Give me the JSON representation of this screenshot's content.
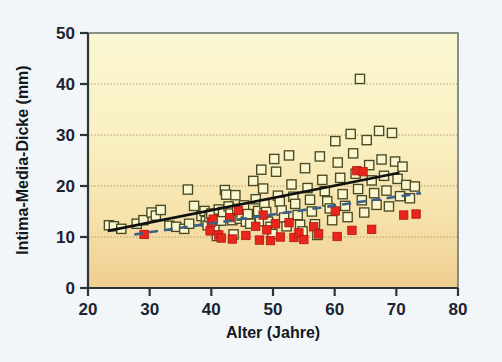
{
  "figure": {
    "background_color": "#f2f6f9",
    "plot_bg_top_color": "#faf6cf",
    "plot_bg_bottom_color": "#f0cf93",
    "plot_border_color": "#4c5a5a"
  },
  "chart_data": {
    "type": "scatter",
    "title": "",
    "xlabel": "Alter (Jahre)",
    "ylabel": "Intima-Media-Dicke (mm)",
    "xlim": [
      20,
      80
    ],
    "ylim": [
      0,
      50
    ],
    "xticks": [
      20,
      30,
      40,
      50,
      60,
      70,
      80
    ],
    "yticks": [
      0,
      10,
      20,
      30,
      40,
      50
    ],
    "grid": "horizontal-dotted",
    "gridlines_y": [
      10,
      20,
      30,
      40
    ],
    "legend": "none",
    "series": [
      {
        "name": "open-square-series",
        "marker": "open-square",
        "marker_color": "#faf6cf",
        "marker_edge_color": "#4a4a22",
        "points": [
          [
            23.4,
            12.3
          ],
          [
            24.2,
            12.1
          ],
          [
            25.4,
            11.6
          ],
          [
            27.9,
            12.6
          ],
          [
            29.0,
            13.3
          ],
          [
            30.3,
            14.8
          ],
          [
            31.0,
            14.2
          ],
          [
            31.8,
            15.3
          ],
          [
            33.2,
            12.2
          ],
          [
            34.3,
            12.0
          ],
          [
            35.6,
            11.6
          ],
          [
            36.2,
            19.3
          ],
          [
            36.4,
            12.6
          ],
          [
            37.2,
            16.1
          ],
          [
            38.4,
            14.1
          ],
          [
            38.9,
            15.1
          ],
          [
            39.1,
            13.1
          ],
          [
            39.4,
            12.3
          ],
          [
            39.7,
            13.9
          ],
          [
            40.0,
            14.6
          ],
          [
            40.2,
            12.7
          ],
          [
            40.5,
            11.8
          ],
          [
            40.9,
            10.2
          ],
          [
            41.2,
            15.4
          ],
          [
            41.6,
            13.2
          ],
          [
            41.9,
            14.9
          ],
          [
            42.2,
            19.2
          ],
          [
            42.4,
            18.3
          ],
          [
            42.8,
            16.0
          ],
          [
            43.1,
            14.6
          ],
          [
            43.4,
            13.3
          ],
          [
            43.6,
            10.5
          ],
          [
            43.9,
            18.2
          ],
          [
            44.2,
            15.5
          ],
          [
            44.6,
            13.6
          ],
          [
            44.9,
            14.2
          ],
          [
            45.3,
            16.2
          ],
          [
            45.6,
            13.0
          ],
          [
            45.9,
            14.5
          ],
          [
            46.3,
            12.6
          ],
          [
            46.8,
            21.0
          ],
          [
            47.2,
            17.4
          ],
          [
            47.6,
            15.1
          ],
          [
            47.9,
            13.1
          ],
          [
            48.1,
            23.2
          ],
          [
            48.4,
            19.5
          ],
          [
            48.6,
            16.4
          ],
          [
            48.9,
            14.9
          ],
          [
            49.2,
            13.0
          ],
          [
            49.6,
            12.0
          ],
          [
            49.9,
            10.6
          ],
          [
            50.2,
            25.3
          ],
          [
            50.5,
            22.8
          ],
          [
            50.8,
            18.1
          ],
          [
            51.1,
            16.9
          ],
          [
            51.4,
            15.2
          ],
          [
            51.8,
            13.8
          ],
          [
            52.2,
            12.1
          ],
          [
            52.6,
            26.0
          ],
          [
            53.0,
            20.3
          ],
          [
            53.3,
            17.9
          ],
          [
            53.6,
            16.5
          ],
          [
            54.0,
            14.3
          ],
          [
            54.4,
            12.4
          ],
          [
            54.8,
            11.1
          ],
          [
            55.2,
            23.5
          ],
          [
            55.6,
            19.6
          ],
          [
            56.0,
            17.3
          ],
          [
            56.3,
            15.0
          ],
          [
            56.8,
            12.5
          ],
          [
            57.2,
            10.4
          ],
          [
            57.6,
            25.8
          ],
          [
            58.0,
            21.2
          ],
          [
            58.4,
            19.0
          ],
          [
            58.8,
            17.0
          ],
          [
            59.2,
            15.6
          ],
          [
            59.6,
            13.3
          ],
          [
            60.1,
            28.8
          ],
          [
            60.5,
            24.6
          ],
          [
            60.9,
            21.6
          ],
          [
            61.3,
            18.4
          ],
          [
            61.7,
            16.1
          ],
          [
            62.1,
            13.9
          ],
          [
            62.6,
            30.2
          ],
          [
            63.0,
            26.4
          ],
          [
            63.4,
            22.4
          ],
          [
            63.8,
            19.4
          ],
          [
            64.1,
            41.0
          ],
          [
            64.4,
            17.2
          ],
          [
            64.8,
            14.8
          ],
          [
            65.2,
            29.0
          ],
          [
            65.6,
            24.1
          ],
          [
            66.0,
            21.1
          ],
          [
            66.4,
            18.6
          ],
          [
            66.8,
            16.3
          ],
          [
            67.2,
            30.8
          ],
          [
            67.6,
            25.2
          ],
          [
            68.0,
            22.0
          ],
          [
            68.4,
            19.1
          ],
          [
            68.8,
            16.0
          ],
          [
            69.3,
            30.4
          ],
          [
            69.8,
            24.8
          ],
          [
            70.2,
            21.4
          ],
          [
            70.6,
            18.0
          ],
          [
            71.0,
            23.8
          ],
          [
            71.6,
            20.2
          ],
          [
            72.2,
            17.6
          ],
          [
            73.0,
            19.9
          ]
        ]
      },
      {
        "name": "red-filled-square-series",
        "marker": "filled-square",
        "marker_color": "#e8261c",
        "marker_edge_color": "#b21410",
        "points": [
          [
            29.1,
            10.5
          ],
          [
            39.8,
            11.2
          ],
          [
            40.0,
            12.9
          ],
          [
            40.3,
            13.5
          ],
          [
            41.2,
            10.4
          ],
          [
            41.6,
            9.8
          ],
          [
            43.0,
            13.8
          ],
          [
            43.4,
            9.6
          ],
          [
            44.4,
            15.2
          ],
          [
            45.6,
            10.3
          ],
          [
            47.2,
            12.1
          ],
          [
            47.8,
            9.4
          ],
          [
            48.4,
            14.3
          ],
          [
            49.0,
            11.4
          ],
          [
            49.6,
            9.3
          ],
          [
            50.4,
            12.6
          ],
          [
            51.2,
            10.0
          ],
          [
            52.6,
            12.8
          ],
          [
            53.4,
            9.9
          ],
          [
            54.2,
            10.8
          ],
          [
            55.0,
            9.5
          ],
          [
            56.6,
            12.0
          ],
          [
            57.4,
            10.6
          ],
          [
            60.1,
            15.1
          ],
          [
            60.4,
            10.1
          ],
          [
            62.8,
            11.3
          ],
          [
            63.6,
            23.0
          ],
          [
            64.6,
            22.8
          ],
          [
            66.0,
            11.5
          ],
          [
            71.2,
            14.3
          ],
          [
            73.2,
            14.5
          ]
        ]
      }
    ],
    "trend_lines": [
      {
        "name": "solid-black-regression-line",
        "style": "solid",
        "color": "#111111",
        "width_px": 2.6,
        "x_start": 23.2,
        "y_start": 11.2,
        "x_end": 70.5,
        "y_end": 22.6
      },
      {
        "name": "dashed-blue-regression-line",
        "style": "dashed",
        "color": "#3b5f86",
        "width_px": 2.6,
        "x_start": 27.5,
        "y_start": 10.5,
        "x_end": 74.0,
        "y_end": 18.6
      }
    ]
  }
}
